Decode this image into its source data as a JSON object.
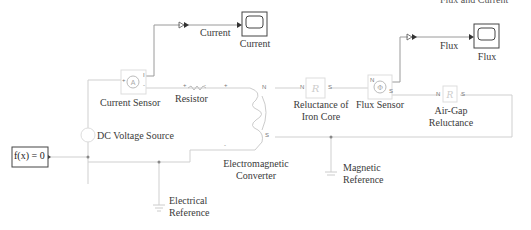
{
  "diagram": {
    "top_right_truncated_text": "Flux and Current",
    "blocks": {
      "constant": {
        "label": "f(x) = 0"
      },
      "dc_source": {
        "label": "DC Voltage Source"
      },
      "current_sensor": {
        "label": "Current Sensor",
        "glyph": "A",
        "ports": {
          "plus": "+",
          "minus": "-",
          "out": "I"
        }
      },
      "resistor": {
        "label": "Resistor",
        "ports": {
          "plus": "+",
          "minus": "-"
        }
      },
      "converter": {
        "label_line1": "Electromagnetic",
        "label_line2": "Converter",
        "ports": {
          "plus": "+",
          "minus": "-",
          "n": "N",
          "s": "S"
        }
      },
      "iron_core": {
        "label_line1": "Reluctance of",
        "label_line2": "Iron Core",
        "glyph": "R",
        "ports": {
          "n": "N",
          "s": "S"
        }
      },
      "flux_sensor": {
        "label": "Flux Sensor",
        "ports": {
          "n": "N",
          "s": "S"
        }
      },
      "air_gap": {
        "label_line1": "Air-Gap",
        "label_line2": "Reluctance",
        "glyph": "R",
        "ports": {
          "n": "N",
          "s": "S"
        }
      },
      "elec_ref": {
        "label_line1": "Electrical",
        "label_line2": "Reference"
      },
      "mag_ref": {
        "label_line1": "Magnetic",
        "label_line2": "Reference"
      },
      "scope_current": {
        "label": "Current"
      },
      "scope_flux": {
        "label": "Flux"
      }
    },
    "signals": {
      "current": "Current",
      "flux": "Flux"
    },
    "colors": {
      "wire": "#c8c8c8",
      "signal": "#8a8a8a",
      "block_border": "#444444",
      "faint_block": "#d8d8d8",
      "text": "#3a3a3a"
    }
  }
}
